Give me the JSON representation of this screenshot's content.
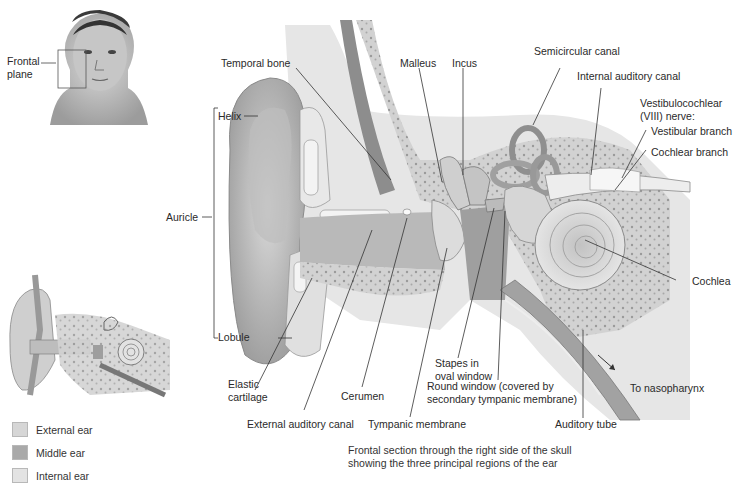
{
  "figure": {
    "caption": "Frontal section through the right side of the skull\nshowing the three principal regions of the ear",
    "inset_face": {
      "label": "Frontal\nplane"
    },
    "labels": {
      "temporal_bone": "Temporal bone",
      "malleus": "Malleus",
      "incus": "Incus",
      "semicircular_canal": "Semicircular canal",
      "internal_auditory_canal": "Internal auditory canal",
      "vestibulocochlear_nerve": "Vestibulocochlear\n(VIII) nerve:",
      "vestibular_branch": "Vestibular branch",
      "cochlear_branch": "Cochlear branch",
      "helix": "Helix",
      "auricle": "Auricle",
      "lobule": "Lobule",
      "cochlea": "Cochlea",
      "stapes": "Stapes in\noval window",
      "round_window": "Round window (covered by\nsecondary tympanic membrane)",
      "to_nasopharynx": "To nasopharynx",
      "elastic_cartilage": "Elastic\ncartilage",
      "cerumen": "Cerumen",
      "external_auditory_canal": "External auditory canal",
      "tympanic_membrane": "Tympanic membrane",
      "auditory_tube": "Auditory tube"
    },
    "legend": [
      {
        "label": "External ear",
        "color": "#d6d6d6"
      },
      {
        "label": "Middle ear",
        "color": "#a9a9a9"
      },
      {
        "label": "Internal ear",
        "color": "#e3e3e3"
      }
    ]
  }
}
